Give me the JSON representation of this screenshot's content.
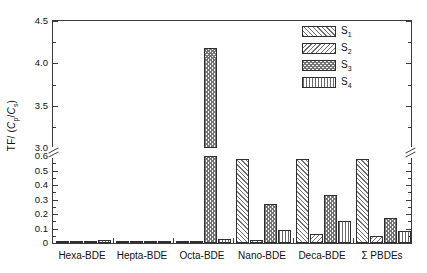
{
  "chart_data": {
    "type": "bar",
    "title": "",
    "xlabel": "",
    "ylabel": "TF/ (C p/C s)",
    "ylabel_parts": {
      "prefix": "TF/ (",
      "c1": "C",
      "sub1": "p",
      "slash": "/",
      "c2": "C",
      "sub2": "s",
      "suffix": ")"
    },
    "categories": [
      "Hexa-BDE",
      "Hepta-BDE",
      "Octa-BDE",
      "Nano-BDE",
      "Deca-BDE",
      "Σ PBDEs"
    ],
    "series": [
      {
        "name": "S1",
        "label": "S",
        "sub": "1",
        "pattern": "diagonal-forward-hatch",
        "values": [
          0.005,
          0.004,
          0.012,
          0.58,
          0.58,
          0.58
        ]
      },
      {
        "name": "S2",
        "label": "S",
        "sub": "2",
        "pattern": "diagonal-back-hatch",
        "values": [
          0.006,
          0.006,
          0.01,
          0.02,
          0.06,
          0.05
        ]
      },
      {
        "name": "S3",
        "label": "S",
        "sub": "3",
        "pattern": "cross-dot-hatch",
        "values": [
          0.01,
          0.008,
          4.18,
          0.27,
          0.33,
          0.17
        ]
      },
      {
        "name": "S4",
        "label": "S",
        "sub": "4",
        "pattern": "vertical-line-hatch",
        "values": [
          0.018,
          0.016,
          0.03,
          0.09,
          0.15,
          0.08
        ]
      }
    ],
    "y_axis": {
      "broken": true,
      "lower_range": [
        0,
        0.6
      ],
      "upper_range": [
        3.0,
        4.5
      ],
      "lower_ticks": [
        0,
        0.1,
        0.2,
        0.3,
        0.4,
        0.5,
        0.6
      ],
      "upper_ticks": [
        3.0,
        3.5,
        4.0,
        4.5
      ],
      "lower_tick_labels": [
        "0",
        "0.1",
        "0.2",
        "0.3",
        "0.4",
        "0.5",
        "0.6"
      ],
      "upper_tick_labels": [
        "3.0",
        "3.5",
        "4.0",
        "4.5"
      ],
      "minor_ticks_between_major": true
    },
    "grid": false,
    "legend_position": "top-right",
    "colors": {
      "axis": "#3a3a3a",
      "hatch": "#6f6f6f",
      "background": "#ffffff",
      "text": "#111111"
    }
  },
  "legend": {
    "entries": [
      {
        "label": "S",
        "sub": "1"
      },
      {
        "label": "S",
        "sub": "2"
      },
      {
        "label": "S",
        "sub": "3"
      },
      {
        "label": "S",
        "sub": "4"
      }
    ]
  },
  "axis_labels": {
    "y_ticks": [
      "4.5",
      "4.0",
      "3.5",
      "3.0",
      "0.6",
      "0.5",
      "0.4",
      "0.3",
      "0.2",
      "0.1",
      "0"
    ],
    "x_ticks": [
      "Hexa-BDE",
      "Hepta-BDE",
      "Octa-BDE",
      "Nano-BDE",
      "Deca-BDE",
      "Σ PBDEs"
    ]
  }
}
